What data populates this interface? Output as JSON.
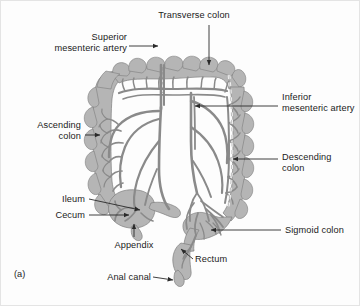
{
  "figure": {
    "caption": "(a)",
    "title_implied": "Large intestine with mesenteric arterial supply",
    "colors": {
      "background": "#fdfdfd",
      "colon_wall": "#b5b5b5",
      "colon_wall_dark": "#a3a3a3",
      "vessel": "#8a8a8a",
      "vessel_dark": "#7b7b7b",
      "outline": "#6e6e6e",
      "lumen": "#fbfbfb",
      "leader": "#2a2a2a",
      "text": "#1b1b1b"
    },
    "labels": [
      {
        "id": "transverse-colon",
        "text": "Transverse colon",
        "align": "center",
        "x": 143,
        "y": 9,
        "width": 100,
        "leader": {
          "type": "arrow",
          "points": "208,24 208,66"
        }
      },
      {
        "id": "superior-mesenteric-artery",
        "text": "Superior\nmesenteric artery",
        "align": "right",
        "x": 20,
        "y": 31,
        "width": 126,
        "leader": {
          "type": "arrow",
          "points": "150,45 161,45"
        }
      },
      {
        "id": "inferior-mesenteric-artery",
        "text": "Inferior\nmesenteric artery",
        "align": "left",
        "x": 281,
        "y": 91,
        "width": 76,
        "leader": {
          "type": "arrow",
          "points": "277,105 193,105"
        }
      },
      {
        "id": "ascending-colon",
        "text": "Ascending\ncolon",
        "align": "right",
        "x": 10,
        "y": 119,
        "width": 70,
        "leader": {
          "type": "arrow",
          "points": "84,134 100,134"
        }
      },
      {
        "id": "descending-colon",
        "text": "Descending\ncolon",
        "align": "left",
        "x": 281,
        "y": 151,
        "width": 76,
        "leader": {
          "type": "arrow",
          "points": "277,158 231,158"
        }
      },
      {
        "id": "ileum",
        "text": "Ileum",
        "align": "right",
        "x": 30,
        "y": 193,
        "width": 54,
        "leader": {
          "type": "arrow",
          "points": "88,198 141,210"
        }
      },
      {
        "id": "cecum",
        "text": "Cecum",
        "align": "right",
        "x": 24,
        "y": 209,
        "width": 60,
        "leader": {
          "type": "arrow",
          "points": "88,214 130,214"
        }
      },
      {
        "id": "appendix",
        "text": "Appendix",
        "align": "center",
        "x": 98,
        "y": 238,
        "width": 58,
        "leader": {
          "type": "arrow",
          "points": "131,236 133,222"
        }
      },
      {
        "id": "sigmoid-colon",
        "text": "Sigmoid colon",
        "align": "left",
        "x": 284,
        "y": 224,
        "width": 70,
        "leader": {
          "type": "arrow",
          "points": "280,229 209,229"
        }
      },
      {
        "id": "rectum",
        "text": "Rectum",
        "align": "left",
        "x": 192,
        "y": 258,
        "width": 50,
        "leader": {
          "type": "arrow",
          "points": "190,259 178,249"
        }
      },
      {
        "id": "anal-canal",
        "text": "Anal canal",
        "align": "right",
        "x": 92,
        "y": 272,
        "width": 58,
        "leader": {
          "type": "arrow",
          "points": "154,276 170,276"
        }
      }
    ]
  }
}
